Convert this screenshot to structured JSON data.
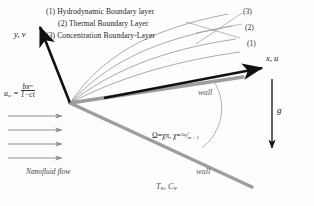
{
  "figure": {
    "legend": [
      {
        "id": "1",
        "text": "(1) Hydrodynamic Boundary layer"
      },
      {
        "id": "2",
        "text": "(2) Thermal Boundary Layer"
      },
      {
        "id": "3",
        "text": "(3) Concentration Boundary-Layer"
      }
    ],
    "curve_labels": [
      {
        "name": "curve-label-3",
        "text": "(3)"
      },
      {
        "name": "curve-label-2",
        "text": "(2)"
      },
      {
        "name": "curve-label-1",
        "text": "(1)"
      }
    ],
    "axes": {
      "vertical": "y, v",
      "horizontal": "x, u"
    },
    "wall_upper": "wall",
    "wall_lower": "wall",
    "wall_conditions": "Tᵥ, Cᵥ",
    "wall_conditions_parts": {
      "t": "T",
      "tsub": "w",
      "c": "C",
      "csub": "w"
    },
    "flow_label": "Nanofluid flow",
    "gravity_symbol": "g",
    "wall_velocity": {
      "lhs": "u",
      "lhs_sub": "w",
      "eq": "=",
      "numerator": "bx",
      "numerator_exp": "m",
      "denominator": "1−ct"
    },
    "wedge_angle": {
      "omega": "Ω",
      "eq1": "=",
      "chi_pi": "χπ",
      "comma": ",",
      "chi": "χ",
      "eq2": "=",
      "frac_num": "2m",
      "frac_den": "m + 1"
    }
  },
  "colors": {
    "axis_black": "#111111",
    "wedge_gray": "#9a9a9a",
    "curve_gray": "#9b9b9b",
    "arrow_gray": "#8e8e8e",
    "background": "#fdfdfd",
    "text": "#1a1a1a"
  }
}
